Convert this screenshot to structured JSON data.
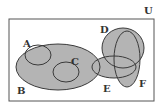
{
  "diagram": {
    "type": "venn",
    "universe_label": "U",
    "sets": [
      {
        "label": "A",
        "shape": "ellipse",
        "cx": 38,
        "cy": 55,
        "rx": 13,
        "ry": 10,
        "label_x": 26,
        "label_y": 46
      },
      {
        "label": "B",
        "shape": "ellipse",
        "cx": 58,
        "cy": 67,
        "rx": 42,
        "ry": 23,
        "label_x": 20,
        "label_y": 93
      },
      {
        "label": "C",
        "shape": "ellipse",
        "cx": 66,
        "cy": 72,
        "rx": 13,
        "ry": 10,
        "label_x": 73,
        "label_y": 63
      },
      {
        "label": "D",
        "shape": "ellipse",
        "cx": 123,
        "cy": 48,
        "rx": 21,
        "ry": 20,
        "label_x": 102,
        "label_y": 32
      },
      {
        "label": "E",
        "shape": "ellipse",
        "cx": 114,
        "cy": 67,
        "rx": 22,
        "ry": 11,
        "label_x": 105,
        "label_y": 91
      },
      {
        "label": "F",
        "shape": "ellipse",
        "cx": 127,
        "cy": 59,
        "rx": 13,
        "ry": 28,
        "label_x": 140,
        "label_y": 86
      }
    ],
    "universe_rect": {
      "x": 9,
      "y": 19,
      "width": 145,
      "height": 82
    },
    "colors": {
      "fill": "#b4b4b4",
      "stroke": "#3a3a3a",
      "background": "#ffffff"
    }
  }
}
